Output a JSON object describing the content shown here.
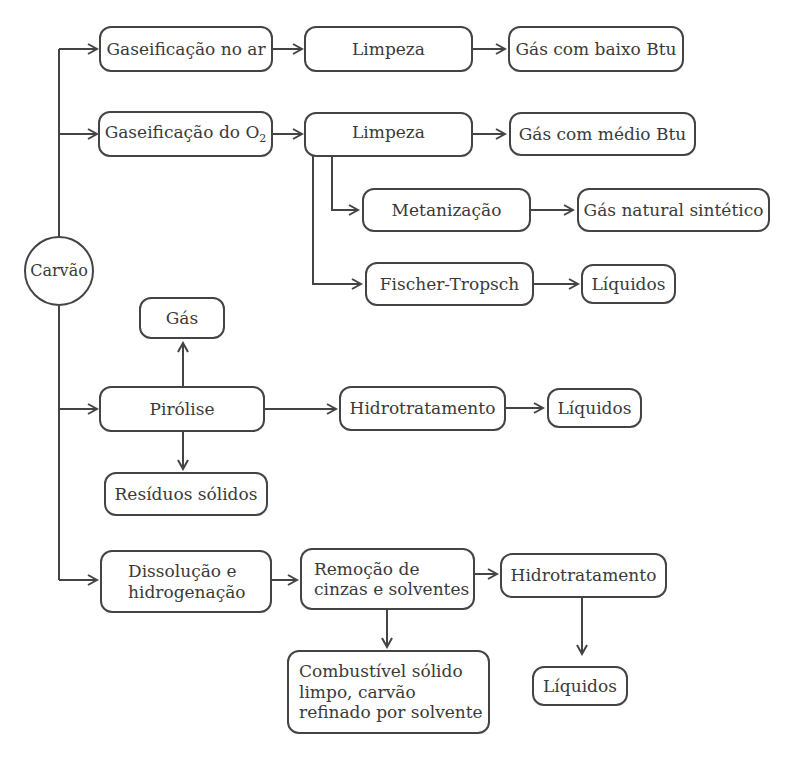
{
  "diagram": {
    "root": "Carvão",
    "nodes": {
      "gas_ar": "Gaseificação no ar",
      "limpeza1": "Limpeza",
      "gas_baixo": "Gás com baixo Btu",
      "gas_o2": "Gaseificação do O",
      "gas_o2_sub": "2",
      "limpeza2": "Limpeza",
      "gas_medio": "Gás com médio Btu",
      "metanizacao": "Metanização",
      "gas_natural": "Gás natural sintético",
      "fischer": "Fischer-Tropsch",
      "liquidos1": "Líquidos",
      "gas": "Gás",
      "pirolise": "Pirólise",
      "hidro1": "Hidrotratamento",
      "liquidos2": "Líquidos",
      "residuos": "Resíduos sólidos",
      "dissolucao_l1": "Dissolução e",
      "dissolucao_l2": "hidrogenação",
      "remocao_l1": "Remoção de",
      "remocao_l2": "cinzas e solventes",
      "hidro2": "Hidrotratamento",
      "combustivel_l1": "Combustível sólido",
      "combustivel_l2": "limpo, carvão",
      "combustivel_l3": "refinado por solvente",
      "liquidos3": "Líquidos"
    },
    "edges": [
      [
        "Carvão",
        "Gaseificação no ar"
      ],
      [
        "Gaseificação no ar",
        "Limpeza"
      ],
      [
        "Limpeza",
        "Gás com baixo Btu"
      ],
      [
        "Carvão",
        "Gaseificação do O2"
      ],
      [
        "Gaseificação do O2",
        "Limpeza"
      ],
      [
        "Limpeza",
        "Gás com médio Btu"
      ],
      [
        "Limpeza",
        "Metanização"
      ],
      [
        "Metanização",
        "Gás natural sintético"
      ],
      [
        "Limpeza",
        "Fischer-Tropsch"
      ],
      [
        "Fischer-Tropsch",
        "Líquidos"
      ],
      [
        "Carvão",
        "Pirólise"
      ],
      [
        "Pirólise",
        "Gás"
      ],
      [
        "Pirólise",
        "Resíduos sólidos"
      ],
      [
        "Pirólise",
        "Hidrotratamento"
      ],
      [
        "Hidrotratamento",
        "Líquidos"
      ],
      [
        "Carvão",
        "Dissolução e hidrogenação"
      ],
      [
        "Dissolução e hidrogenação",
        "Remoção de cinzas e solventes"
      ],
      [
        "Remoção de cinzas e solventes",
        "Hidrotratamento"
      ],
      [
        "Remoção de cinzas e solventes",
        "Combustível sólido limpo, carvão refinado por solvente"
      ],
      [
        "Hidrotratamento",
        "Líquidos"
      ]
    ]
  }
}
